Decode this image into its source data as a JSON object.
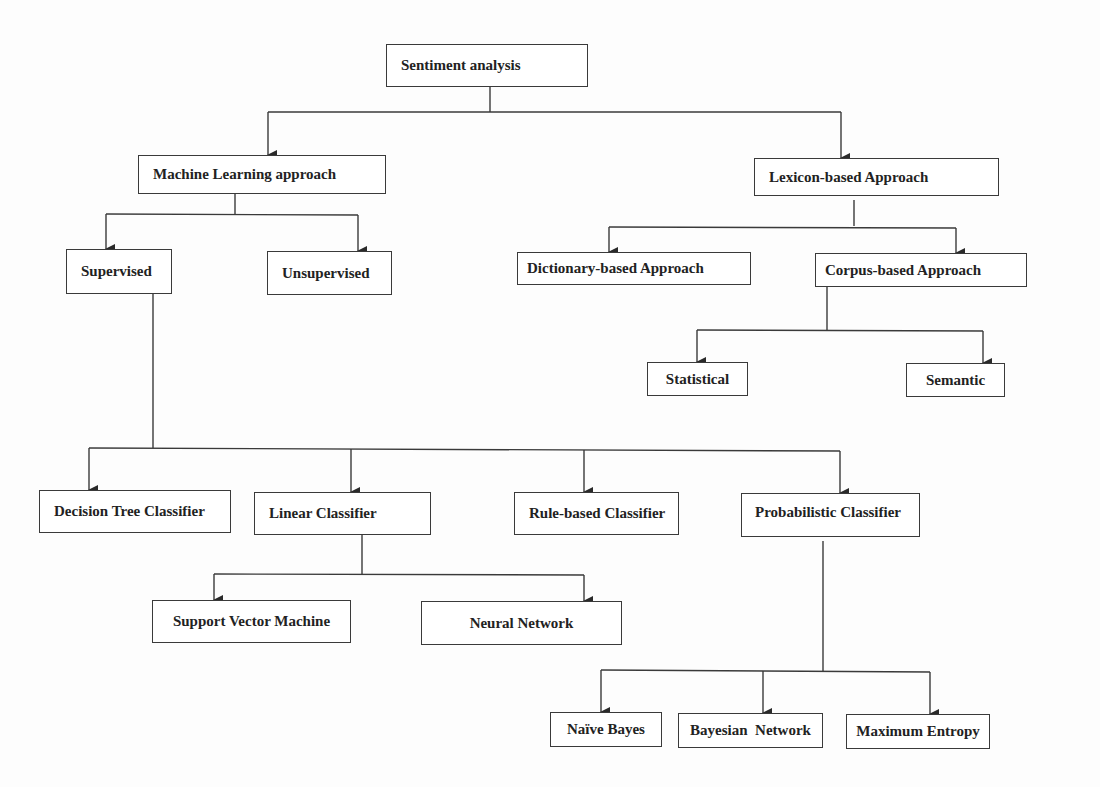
{
  "diagram": {
    "title": "Sentiment analysis",
    "nodes": {
      "root": "Sentiment analysis",
      "ml": "Machine Learning  approach",
      "lexicon": "Lexicon-based Approach",
      "supervised": "Supervised",
      "unsupervised": "Unsupervised",
      "dictionary": "Dictionary-based Approach",
      "corpus": "Corpus-based Approach",
      "statistical": "Statistical",
      "semantic": "Semantic",
      "decision_tree": "Decision Tree Classifier",
      "linear": "Linear Classifier",
      "rule_based": "Rule-based Classifier",
      "probabilistic": "Probabilistic Classifier",
      "svm": "Support Vector Machine",
      "neural": "Neural Network",
      "naive_bayes": "Naïve Bayes",
      "bayesian": "Bayesian  Network",
      "max_entropy": "Maximum Entropy"
    },
    "edges": [
      [
        "root",
        "ml"
      ],
      [
        "root",
        "lexicon"
      ],
      [
        "ml",
        "supervised"
      ],
      [
        "ml",
        "unsupervised"
      ],
      [
        "lexicon",
        "dictionary"
      ],
      [
        "lexicon",
        "corpus"
      ],
      [
        "corpus",
        "statistical"
      ],
      [
        "corpus",
        "semantic"
      ],
      [
        "supervised",
        "decision_tree"
      ],
      [
        "supervised",
        "linear"
      ],
      [
        "supervised",
        "rule_based"
      ],
      [
        "supervised",
        "probabilistic"
      ],
      [
        "linear",
        "svm"
      ],
      [
        "linear",
        "neural"
      ],
      [
        "probabilistic",
        "naive_bayes"
      ],
      [
        "probabilistic",
        "bayesian"
      ],
      [
        "probabilistic",
        "max_entropy"
      ]
    ],
    "colors": {
      "line": "#3a3a3a",
      "text": "#222222",
      "background": "#fdfdfd"
    }
  }
}
